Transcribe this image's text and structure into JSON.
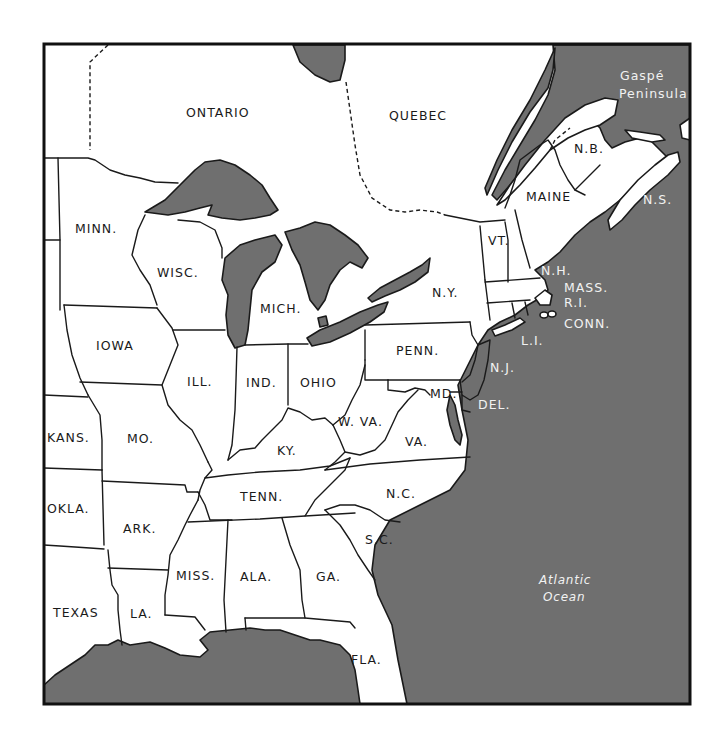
{
  "map": {
    "title": "Eastern United States and Southeastern Canada",
    "colors": {
      "water": "#6f6f6f",
      "land": "#ffffff",
      "outline": "#1a1a1a",
      "water_label": "#f2f2f2"
    },
    "provinces": [
      {
        "id": "ontario",
        "label": "ONTARIO"
      },
      {
        "id": "quebec",
        "label": "QUEBEC"
      },
      {
        "id": "new-brunswick",
        "label": "N.B."
      },
      {
        "id": "nova-scotia",
        "label": "N.S."
      }
    ],
    "features": [
      {
        "id": "gaspe",
        "label_line1": "Gaspé",
        "label_line2": "Peninsula"
      },
      {
        "id": "long-island",
        "label": "L.I."
      }
    ],
    "states": [
      {
        "id": "minnesota",
        "label": "MINN."
      },
      {
        "id": "wisconsin",
        "label": "WISC."
      },
      {
        "id": "michigan",
        "label": "MICH."
      },
      {
        "id": "iowa",
        "label": "IOWA"
      },
      {
        "id": "illinois",
        "label": "ILL."
      },
      {
        "id": "indiana",
        "label": "IND."
      },
      {
        "id": "ohio",
        "label": "OHIO"
      },
      {
        "id": "kansas",
        "label": "KANS."
      },
      {
        "id": "missouri",
        "label": "MO."
      },
      {
        "id": "kentucky",
        "label": "KY."
      },
      {
        "id": "west-virginia",
        "label": "W. VA."
      },
      {
        "id": "virginia",
        "label": "VA."
      },
      {
        "id": "oklahoma",
        "label": "OKLA."
      },
      {
        "id": "arkansas",
        "label": "ARK."
      },
      {
        "id": "tennessee",
        "label": "TENN."
      },
      {
        "id": "north-carolina",
        "label": "N.C."
      },
      {
        "id": "south-carolina",
        "label": "S.C."
      },
      {
        "id": "texas",
        "label": "TEXAS"
      },
      {
        "id": "louisiana",
        "label": "LA."
      },
      {
        "id": "mississippi",
        "label": "MISS."
      },
      {
        "id": "alabama",
        "label": "ALA."
      },
      {
        "id": "georgia",
        "label": "GA."
      },
      {
        "id": "florida",
        "label": "FLA."
      },
      {
        "id": "new-york",
        "label": "N.Y."
      },
      {
        "id": "pennsylvania",
        "label": "PENN."
      },
      {
        "id": "maryland",
        "label": "MD."
      },
      {
        "id": "delaware",
        "label": "DEL."
      },
      {
        "id": "new-jersey",
        "label": "N.J."
      },
      {
        "id": "vermont",
        "label": "VT."
      },
      {
        "id": "new-hampshire",
        "label": "N.H."
      },
      {
        "id": "maine",
        "label": "MAINE"
      },
      {
        "id": "massachusetts",
        "label": "MASS."
      },
      {
        "id": "rhode-island",
        "label": "R.I."
      },
      {
        "id": "connecticut",
        "label": "CONN."
      }
    ],
    "water_bodies": [
      {
        "id": "atlantic",
        "label_line1": "Atlantic",
        "label_line2": "Ocean"
      }
    ]
  }
}
